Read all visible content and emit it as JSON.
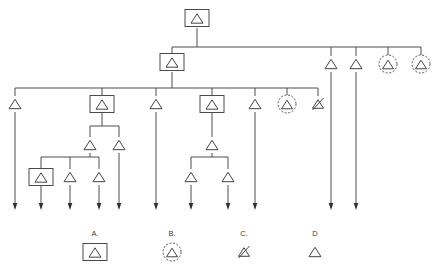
{
  "diagram": {
    "canvas": {
      "width": 439,
      "height": 270
    },
    "symbol_types": {
      "A": {
        "name": "boxed-triangle",
        "description": "triangle enclosed in rectangle"
      },
      "B": {
        "name": "dashed-circled-triangle",
        "description": "triangle enclosed in dashed circle"
      },
      "C": {
        "name": "slashed-triangle",
        "description": "triangle with slash through it"
      },
      "D": {
        "name": "plain-triangle",
        "description": "plain triangle"
      }
    },
    "colors": {
      "wire": "#4c4c4c",
      "node_stroke": "#444444",
      "node_fill": "#ffffff",
      "arrow": "#2f2f2f",
      "background": "#ffffff",
      "label": "#3a3a3a"
    },
    "buses": [
      {
        "name": "root-bus",
        "y": 47,
        "x1": 172,
        "x2": 421
      },
      {
        "name": "level2-bus",
        "y": 88,
        "x1": 15,
        "x2": 318
      },
      {
        "name": "l3a-bus",
        "y": 126,
        "x1": 90,
        "x2": 119
      },
      {
        "name": "l4a-bus",
        "y": 157,
        "x1": 41,
        "x2": 99
      },
      {
        "name": "l3b-bus",
        "y": 157,
        "x1": 191,
        "x2": 228
      }
    ],
    "nodes": [
      {
        "name": "root",
        "type": "A",
        "x": 197,
        "y": 18
      },
      {
        "name": "level2",
        "type": "A",
        "x": 172,
        "y": 62
      },
      {
        "name": "l2-branch-1",
        "type": "D",
        "x": 15,
        "y": 104
      },
      {
        "name": "l2-branch-2",
        "type": "A",
        "x": 102,
        "y": 104
      },
      {
        "name": "l2-branch-3",
        "type": "D",
        "x": 156,
        "y": 104
      },
      {
        "name": "l2-branch-4",
        "type": "A",
        "x": 212,
        "y": 104
      },
      {
        "name": "l2-branch-5",
        "type": "D",
        "x": 255,
        "y": 104
      },
      {
        "name": "l2-branch-6",
        "type": "B",
        "x": 287,
        "y": 104
      },
      {
        "name": "l2-branch-7",
        "type": "C",
        "x": 318,
        "y": 104
      },
      {
        "name": "root-branch-1",
        "type": "D",
        "x": 331,
        "y": 64
      },
      {
        "name": "root-branch-2",
        "type": "D",
        "x": 356,
        "y": 64
      },
      {
        "name": "root-branch-3",
        "type": "B",
        "x": 388,
        "y": 64
      },
      {
        "name": "root-branch-4",
        "type": "B",
        "x": 421,
        "y": 64
      },
      {
        "name": "l3a-left",
        "type": "D",
        "x": 90,
        "y": 145
      },
      {
        "name": "l3a-right",
        "type": "D",
        "x": 119,
        "y": 145
      },
      {
        "name": "l4a-1",
        "type": "A",
        "x": 41,
        "y": 177
      },
      {
        "name": "l4a-2",
        "type": "D",
        "x": 70,
        "y": 177
      },
      {
        "name": "l4a-3",
        "type": "D",
        "x": 99,
        "y": 177
      },
      {
        "name": "l3b-parent",
        "type": "D",
        "x": 212,
        "y": 145
      },
      {
        "name": "l3b-1",
        "type": "D",
        "x": 191,
        "y": 177
      },
      {
        "name": "l3b-2",
        "type": "D",
        "x": 228,
        "y": 177
      }
    ],
    "terminals": [
      {
        "name": "terminal-1",
        "x": 15,
        "y_from": 112,
        "y_to": 210
      },
      {
        "name": "terminal-2",
        "x": 41,
        "y_from": 185,
        "y_to": 210
      },
      {
        "name": "terminal-3",
        "x": 70,
        "y_from": 185,
        "y_to": 210
      },
      {
        "name": "terminal-4",
        "x": 99,
        "y_from": 185,
        "y_to": 210
      },
      {
        "name": "terminal-5",
        "x": 119,
        "y_from": 153,
        "y_to": 210
      },
      {
        "name": "terminal-6",
        "x": 156,
        "y_from": 112,
        "y_to": 210
      },
      {
        "name": "terminal-7",
        "x": 191,
        "y_from": 185,
        "y_to": 210
      },
      {
        "name": "terminal-8",
        "x": 228,
        "y_from": 185,
        "y_to": 210
      },
      {
        "name": "terminal-9",
        "x": 255,
        "y_from": 112,
        "y_to": 210
      },
      {
        "name": "terminal-10",
        "x": 331,
        "y_from": 72,
        "y_to": 210
      },
      {
        "name": "terminal-11",
        "x": 356,
        "y_from": 72,
        "y_to": 210
      }
    ],
    "connectors": [
      {
        "name": "root-to-bus",
        "x": 197,
        "y_from": 28,
        "y_to": 47
      },
      {
        "name": "bus-to-level2",
        "x": 172,
        "y_from": 47,
        "y_to": 54
      },
      {
        "name": "level2-to-bus",
        "x": 172,
        "y_from": 72,
        "y_to": 88
      },
      {
        "name": "drop-b1",
        "x": 15,
        "y_from": 88,
        "y_to": 96
      },
      {
        "name": "drop-b2",
        "x": 102,
        "y_from": 88,
        "y_to": 96
      },
      {
        "name": "drop-b3",
        "x": 156,
        "y_from": 88,
        "y_to": 96
      },
      {
        "name": "drop-b4",
        "x": 212,
        "y_from": 88,
        "y_to": 96
      },
      {
        "name": "drop-b5",
        "x": 255,
        "y_from": 88,
        "y_to": 96
      },
      {
        "name": "drop-b6",
        "x": 287,
        "y_from": 88,
        "y_to": 96
      },
      {
        "name": "drop-b7",
        "x": 318,
        "y_from": 88,
        "y_to": 96
      },
      {
        "name": "drop-rb1",
        "x": 331,
        "y_from": 47,
        "y_to": 56
      },
      {
        "name": "drop-rb2",
        "x": 356,
        "y_from": 47,
        "y_to": 56
      },
      {
        "name": "drop-rb3",
        "x": 388,
        "y_from": 47,
        "y_to": 56
      },
      {
        "name": "drop-rb4",
        "x": 421,
        "y_from": 47,
        "y_to": 56
      },
      {
        "name": "b2-to-l3abus",
        "x": 102,
        "y_from": 112,
        "y_to": 126
      },
      {
        "name": "l3a-left-drop",
        "x": 90,
        "y_from": 126,
        "y_to": 137
      },
      {
        "name": "l3a-right-drop",
        "x": 119,
        "y_from": 126,
        "y_to": 137
      },
      {
        "name": "l3a-to-l4abus",
        "x": 90,
        "y_from": 153,
        "y_to": 157
      },
      {
        "name": "l4a-drop-1",
        "x": 41,
        "y_from": 157,
        "y_to": 169
      },
      {
        "name": "l4a-drop-2",
        "x": 70,
        "y_from": 157,
        "y_to": 169
      },
      {
        "name": "l4a-drop-3",
        "x": 99,
        "y_from": 157,
        "y_to": 169
      },
      {
        "name": "b4-to-l3b",
        "x": 212,
        "y_from": 112,
        "y_to": 137
      },
      {
        "name": "l3b-to-bus",
        "x": 212,
        "y_from": 153,
        "y_to": 157
      },
      {
        "name": "l3b-drop-1",
        "x": 191,
        "y_from": 157,
        "y_to": 169
      },
      {
        "name": "l3b-drop-2",
        "x": 228,
        "y_from": 157,
        "y_to": 169
      }
    ],
    "legend": [
      {
        "key": "A",
        "label": "A.",
        "type": "A",
        "x": 95,
        "label_y": 236,
        "symbol_y": 252
      },
      {
        "key": "B",
        "label": "B.",
        "type": "B",
        "x": 172,
        "label_y": 236,
        "symbol_y": 252
      },
      {
        "key": "C",
        "label": "C.",
        "type": "C",
        "x": 244,
        "label_y": 236,
        "symbol_y": 252
      },
      {
        "key": "D",
        "label": "D",
        "type": "D",
        "x": 315,
        "label_y": 236,
        "symbol_y": 252
      }
    ]
  }
}
